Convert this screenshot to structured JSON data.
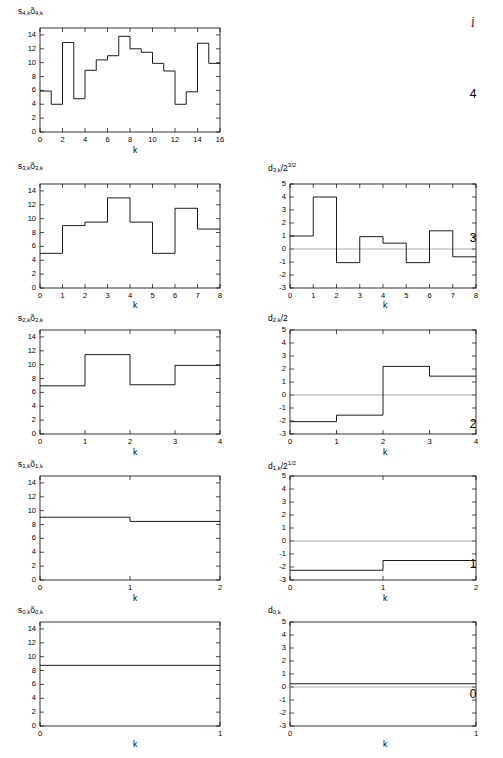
{
  "figure": {
    "j_header": "j",
    "levels": [
      "4",
      "3",
      "2",
      "1",
      "0"
    ],
    "xlabel": "k"
  },
  "chart_data": [
    {
      "id": "s4",
      "type": "bar",
      "title": "",
      "ylabel": "s4,k o4,k",
      "ylabel_parts": {
        "s": "s",
        "sub1": "4,k",
        "o": "õ",
        "sub2": "4,k"
      },
      "xlabel": "k",
      "xlim": [
        0,
        16
      ],
      "ylim": [
        0,
        15
      ],
      "xticks": [
        0,
        2,
        4,
        6,
        8,
        10,
        12,
        14,
        16
      ],
      "yticks": [
        0,
        2,
        4,
        6,
        8,
        10,
        12,
        14
      ],
      "categories": [
        0,
        1,
        2,
        3,
        4,
        5,
        6,
        7,
        8,
        9,
        10,
        11,
        12,
        13,
        14,
        15
      ],
      "values": [
        5.9,
        4.0,
        12.9,
        4.8,
        8.9,
        10.4,
        11.0,
        13.8,
        12.0,
        11.5,
        9.9,
        8.8,
        4.0,
        5.8,
        12.8,
        9.9
      ],
      "step_width": 1,
      "grid": false,
      "zero_line": false
    },
    {
      "id": "s3",
      "type": "bar",
      "ylabel": "s3,k o3,k",
      "ylabel_parts": {
        "s": "s",
        "sub1": "3,k",
        "o": "õ",
        "sub2": "3,k"
      },
      "xlabel": "k",
      "xlim": [
        0,
        8
      ],
      "ylim": [
        0,
        15
      ],
      "xticks": [
        0,
        1,
        2,
        3,
        4,
        5,
        6,
        7,
        8
      ],
      "yticks": [
        0,
        2,
        4,
        6,
        8,
        10,
        12,
        14
      ],
      "categories": [
        0,
        1,
        2,
        3,
        4,
        5,
        6,
        7
      ],
      "values": [
        5.0,
        9.0,
        9.5,
        13.0,
        9.5,
        5.0,
        11.5,
        8.5
      ],
      "step_width": 1,
      "grid": false,
      "zero_line": false
    },
    {
      "id": "d3",
      "type": "bar",
      "ylabel": "d3,k / 2^(3/2)",
      "ylabel_parts": {
        "d": "d",
        "sub1": "3,k",
        "div": "/2",
        "sup": "3/2"
      },
      "xlabel": "k",
      "xlim": [
        0,
        8
      ],
      "ylim": [
        -3,
        5
      ],
      "xticks": [
        0,
        1,
        2,
        3,
        4,
        5,
        6,
        7,
        8
      ],
      "yticks": [
        -3,
        -2,
        -1,
        0,
        1,
        2,
        3,
        4,
        5
      ],
      "categories": [
        0,
        1,
        2,
        3,
        4,
        5,
        6,
        7
      ],
      "values": [
        1.0,
        4.0,
        -1.05,
        0.95,
        0.45,
        -1.05,
        1.4,
        -0.6
      ],
      "step_width": 1,
      "grid": false,
      "zero_line": true
    },
    {
      "id": "s2",
      "type": "bar",
      "ylabel": "s2,k o2,k",
      "ylabel_parts": {
        "s": "s",
        "sub1": "2,k",
        "o": "õ",
        "sub2": "2,k"
      },
      "xlabel": "k",
      "xlim": [
        0,
        4
      ],
      "ylim": [
        0,
        15
      ],
      "xticks": [
        0,
        1,
        2,
        3,
        4
      ],
      "yticks": [
        0,
        2,
        4,
        6,
        8,
        10,
        12,
        14
      ],
      "categories": [
        0,
        1,
        2,
        3
      ],
      "values": [
        6.95,
        11.45,
        7.1,
        9.9
      ],
      "step_width": 1,
      "grid": false,
      "zero_line": false
    },
    {
      "id": "d2",
      "type": "bar",
      "ylabel": "d2,k / 2",
      "ylabel_parts": {
        "d": "d",
        "sub1": "2,k",
        "div": "/2",
        "sup": ""
      },
      "xlabel": "k",
      "xlim": [
        0,
        4
      ],
      "ylim": [
        -3,
        5
      ],
      "xticks": [
        0,
        1,
        2,
        3,
        4
      ],
      "yticks": [
        -3,
        -2,
        -1,
        0,
        1,
        2,
        3,
        4,
        5
      ],
      "categories": [
        0,
        1,
        2,
        3
      ],
      "values": [
        -2.05,
        -1.55,
        2.2,
        1.45
      ],
      "step_width": 1,
      "grid": false,
      "zero_line": true
    },
    {
      "id": "s1",
      "type": "bar",
      "ylabel": "s1,k o1,k",
      "ylabel_parts": {
        "s": "s",
        "sub1": "1,k",
        "o": "õ",
        "sub2": "1,k"
      },
      "xlabel": "k",
      "xlim": [
        0,
        2
      ],
      "ylim": [
        0,
        15
      ],
      "xticks": [
        0,
        1,
        2
      ],
      "yticks": [
        0,
        2,
        4,
        6,
        8,
        10,
        12,
        14
      ],
      "categories": [
        0,
        1
      ],
      "values": [
        9.05,
        8.45
      ],
      "step_width": 1,
      "grid": false,
      "zero_line": false
    },
    {
      "id": "d1",
      "type": "bar",
      "ylabel": "d1,k / 2^(1/2)",
      "ylabel_parts": {
        "d": "d",
        "sub1": "1,k",
        "div": "/2",
        "sup": "1/2"
      },
      "xlabel": "k",
      "xlim": [
        0,
        2
      ],
      "ylim": [
        -3,
        5
      ],
      "xticks": [
        0,
        1,
        2
      ],
      "yticks": [
        -3,
        -2,
        -1,
        0,
        1,
        2,
        3,
        4,
        5
      ],
      "categories": [
        0,
        1
      ],
      "values": [
        -2.25,
        -1.5
      ],
      "step_width": 1,
      "grid": false,
      "zero_line": true
    },
    {
      "id": "s0",
      "type": "bar",
      "ylabel": "s0,k o0,k",
      "ylabel_parts": {
        "s": "s",
        "sub1": "0,k",
        "o": "õ",
        "sub2": "0,k"
      },
      "xlabel": "k",
      "xlim": [
        0,
        1
      ],
      "ylim": [
        0,
        15
      ],
      "xticks": [
        0,
        1
      ],
      "yticks": [
        0,
        2,
        4,
        6,
        8,
        10,
        12,
        14
      ],
      "categories": [
        0
      ],
      "values": [
        8.75
      ],
      "step_width": 1,
      "grid": false,
      "zero_line": false
    },
    {
      "id": "d0",
      "type": "bar",
      "ylabel": "d0,k",
      "ylabel_parts": {
        "d": "d",
        "sub1": "0,k",
        "div": "",
        "sup": ""
      },
      "xlabel": "k",
      "xlim": [
        0,
        1
      ],
      "ylim": [
        -3,
        5
      ],
      "xticks": [
        0,
        1
      ],
      "yticks": [
        -3,
        -2,
        -1,
        0,
        1,
        2,
        3,
        4,
        5
      ],
      "categories": [
        0
      ],
      "values": [
        0.25
      ],
      "step_width": 1,
      "grid": false,
      "zero_line": true
    }
  ]
}
